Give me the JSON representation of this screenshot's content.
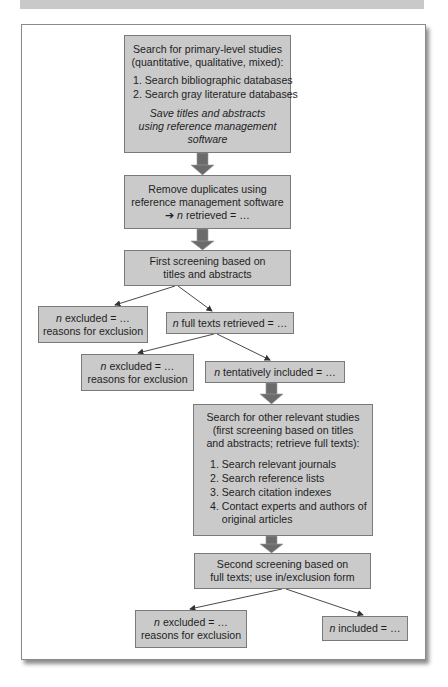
{
  "diagram": {
    "type": "flowchart",
    "nodes": {
      "search_primary": {
        "title_lines": [
          "Search for primary-level studies",
          "(quantitative, qualitative, mixed):"
        ],
        "list": [
          "1. Search bibliographic databases",
          "2. Search gray literature databases"
        ],
        "note_lines": [
          "Save titles and abstracts",
          "using reference management",
          "software"
        ]
      },
      "remove_duplicates": {
        "lines": [
          "Remove duplicates using",
          "reference management software"
        ],
        "arrow_glyph": "➔",
        "n_label": "n",
        "result_text": " retrieved = …"
      },
      "first_screening": {
        "lines": [
          "First screening based on",
          "titles and abstracts"
        ]
      },
      "excluded_1": {
        "n_label": "n",
        "line1_rest": " excluded = …",
        "line2": "reasons for exclusion"
      },
      "full_texts": {
        "n_label": "n",
        "rest": " full texts retrieved = …"
      },
      "excluded_2": {
        "n_label": "n",
        "line1_rest": " excluded = …",
        "line2": "reasons for exclusion"
      },
      "tentatively_included": {
        "n_label": "n",
        "rest": " tentatively included = …"
      },
      "search_other": {
        "title_lines": [
          "Search for other relevant studies",
          "(first screening based on titles",
          "and abstracts; retrieve full texts):"
        ],
        "list": [
          "1. Search relevant journals",
          "2. Search reference lists",
          "3. Search citation indexes",
          "4. Contact experts and authors of",
          "    original articles"
        ]
      },
      "second_screening": {
        "lines": [
          "Second screening based on",
          "full texts; use in/exclusion form"
        ]
      },
      "excluded_3": {
        "n_label": "n",
        "line1_rest": " excluded = …",
        "line2": "reasons for exclusion"
      },
      "included": {
        "n_label": "n",
        "rest": " included = …"
      }
    },
    "edges": [
      {
        "from": "search_primary",
        "to": "remove_duplicates",
        "style": "block-arrow"
      },
      {
        "from": "remove_duplicates",
        "to": "first_screening",
        "style": "block-arrow"
      },
      {
        "from": "first_screening",
        "to": "excluded_1",
        "style": "line-arrow"
      },
      {
        "from": "first_screening",
        "to": "full_texts",
        "style": "line-arrow"
      },
      {
        "from": "full_texts",
        "to": "excluded_2",
        "style": "line-arrow"
      },
      {
        "from": "full_texts",
        "to": "tentatively_included",
        "style": "line-arrow"
      },
      {
        "from": "tentatively_included",
        "to": "search_other",
        "style": "block-arrow"
      },
      {
        "from": "search_other",
        "to": "second_screening",
        "style": "block-arrow"
      },
      {
        "from": "second_screening",
        "to": "excluded_3",
        "style": "line-arrow"
      },
      {
        "from": "second_screening",
        "to": "included",
        "style": "line-arrow"
      }
    ],
    "colors": {
      "box_fill": "#cacaca",
      "box_border": "#7a7a7a",
      "block_arrow": "#6b6b6b",
      "line_arrow": "#333333",
      "top_band": "#c9c9c9"
    }
  }
}
